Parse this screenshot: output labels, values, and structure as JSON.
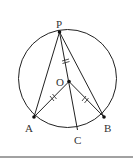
{
  "diagram": {
    "type": "geometry",
    "points": {
      "P": {
        "label": "P"
      },
      "O": {
        "label": "O"
      },
      "A": {
        "label": "A"
      },
      "B": {
        "label": "B"
      },
      "C": {
        "label": "C"
      }
    },
    "colors": {
      "stroke": "#222222",
      "text": "#333333"
    }
  }
}
